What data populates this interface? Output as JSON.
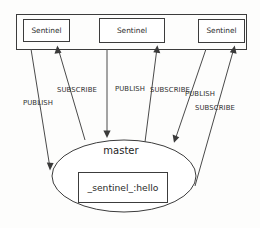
{
  "diagram": {
    "container": {
      "name": "sentinel-group-container",
      "label": ""
    },
    "sentinels": [
      {
        "id": "sentinel-1",
        "label": "Sentinel"
      },
      {
        "id": "sentinel-2",
        "label": "Sentinel"
      },
      {
        "id": "sentinel-3",
        "label": "Sentinel"
      }
    ],
    "master": {
      "label": "master",
      "channel_label": "_sentinel_:hello"
    },
    "edge_labels": [
      {
        "id": "publish-1",
        "text": "PUBLISH"
      },
      {
        "id": "subscribe-1",
        "text": "SUBSCRIBE"
      },
      {
        "id": "publish-2",
        "text": "PUBLISH"
      },
      {
        "id": "subscribe-2",
        "text": "SUBSCRIBE"
      },
      {
        "id": "publish-3",
        "text": "PUBLISH"
      },
      {
        "id": "subscribe-3",
        "text": "SUBSCRIBE"
      }
    ],
    "colors": {
      "stroke": "#3c3c3c",
      "connector": "#4a4a4a",
      "text": "#2b2b2b",
      "background": "#fdfdfc",
      "shape_fill": "#ffffff"
    }
  }
}
